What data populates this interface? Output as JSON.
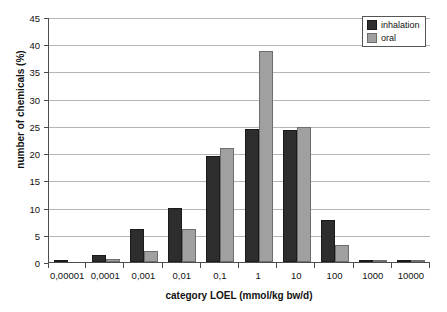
{
  "chart_data": {
    "type": "bar",
    "title": "",
    "xlabel": "category LOEL (mmol/kg bw/d)",
    "ylabel": "number of chemicals (%)",
    "categories": [
      "0,00001",
      "0,0001",
      "0,001",
      "0,01",
      "0,1",
      "1",
      "10",
      "100",
      "1000",
      "10000"
    ],
    "series": [
      {
        "name": "inhalation",
        "color": "#2d2d2d",
        "values": [
          0.3,
          1.2,
          6.0,
          10.0,
          19.5,
          24.5,
          24.2,
          7.7,
          0.4,
          0.4
        ]
      },
      {
        "name": "oral",
        "color": "#a0a0a0",
        "values": [
          0.0,
          0.6,
          2.1,
          6.0,
          21.0,
          38.7,
          24.8,
          3.2,
          0.3,
          0.2
        ]
      }
    ],
    "ylim": [
      0,
      45
    ],
    "ytick_step": 5,
    "yticks": [
      "0",
      "5",
      "10",
      "15",
      "20",
      "25",
      "30",
      "35",
      "40",
      "45"
    ],
    "grid": "horizontal",
    "legend_position": "top-right",
    "legend_entries": [
      "inhalation",
      "oral"
    ]
  }
}
